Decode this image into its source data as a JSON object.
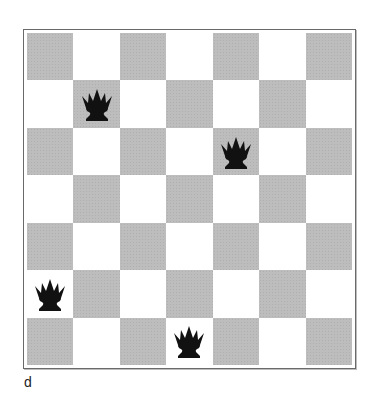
{
  "diagram": {
    "board_size": 7,
    "colors": {
      "dark_square": "#bdbdbd",
      "light_square": "#ffffff",
      "piece": "#111111",
      "frame": "#6a6a6a"
    },
    "pieces": [
      {
        "type": "queen-icon",
        "color": "black",
        "row": 1,
        "col": 1
      },
      {
        "type": "queen-icon",
        "color": "black",
        "row": 2,
        "col": 4
      },
      {
        "type": "queen-icon",
        "color": "black",
        "row": 5,
        "col": 0
      },
      {
        "type": "queen-icon",
        "color": "black",
        "row": 6,
        "col": 3
      }
    ],
    "caption": "d"
  }
}
